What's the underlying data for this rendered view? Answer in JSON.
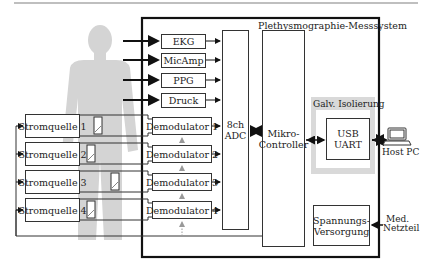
{
  "diagram": {
    "system_title": "Plethysmographie-Messsystem",
    "sensors": [
      "EKG",
      "MicAmp",
      "PPG",
      "Druck"
    ],
    "current_sources": [
      "Stromquelle 1",
      "Stromquelle 2",
      "Stromquelle 3",
      "Stromquelle 4"
    ],
    "demodulators": [
      "Demodulator 1",
      "Demodulator 2",
      "Demodulator 3",
      "Demodulator 4"
    ],
    "adc": {
      "line1": "8ch",
      "line2": "ADC"
    },
    "microcontroller": {
      "line1": "Mikro-",
      "line2": "Controller"
    },
    "isolation": {
      "title": "Galv. Isolierung"
    },
    "usb_uart": {
      "line1": "USB",
      "line2": "UART"
    },
    "power_supply": {
      "line1": "Spannungs-",
      "line2": "Versorgung"
    },
    "host_pc": {
      "label": "Host PC",
      "icon": "laptop-icon"
    },
    "med_power": {
      "line1": "Med.",
      "line2": "Netzteil"
    },
    "body_icon": "human-silhouette-icon",
    "electrode_icon": "electrode-icon",
    "colors": {
      "body_gray": "#d4d4d4",
      "isolation_gray": "#d9d9d9",
      "line": "#222222",
      "border": "#111111"
    }
  }
}
